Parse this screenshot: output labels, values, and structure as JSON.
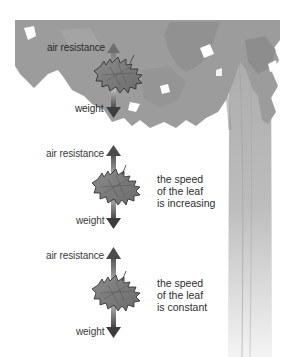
{
  "diagram": {
    "title": "",
    "panels": [
      {
        "id": "top",
        "up_label": "air resistance",
        "down_label": "weight",
        "caption": []
      },
      {
        "id": "middle",
        "up_label": "air resistance",
        "down_label": "weight",
        "caption": [
          "the speed",
          "of the leaf",
          "is increasing"
        ]
      },
      {
        "id": "bottom",
        "up_label": "air resistance",
        "down_label": "weight",
        "caption": [
          "the speed",
          "of the leaf",
          "is constant"
        ]
      }
    ],
    "elements": {
      "tree": "tree-canopy-and-trunk",
      "leaf": "falling-leaf",
      "arrow_up": "air-resistance-arrow",
      "arrow_down": "weight-arrow"
    },
    "colors": {
      "canopy": "#9a9a9a",
      "canopy_dark": "#868686",
      "trunk": "#b4b4b4",
      "leaf": "#7a7a7a",
      "leaf_outline": "#2a2a2a",
      "arrow_dark": "#4a4a4a",
      "text": "#333333"
    }
  }
}
